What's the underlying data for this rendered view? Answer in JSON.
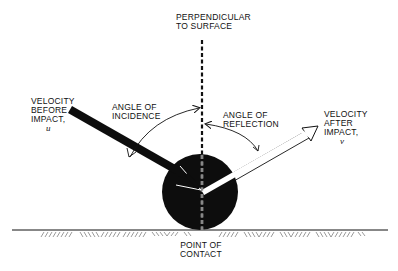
{
  "diagram": {
    "labels": {
      "perpendicular": [
        "PERPENDICULAR",
        "TO SURFACE"
      ],
      "velocity_before": [
        "VELOCITY",
        "BEFORE",
        "IMPACT,"
      ],
      "velocity_before_symbol": "u",
      "angle_incidence": [
        "ANGLE OF",
        "INCIDENCE"
      ],
      "angle_reflection": [
        "ANGLE OF",
        "REFLECTION"
      ],
      "velocity_after": [
        "VELOCITY",
        "AFTER",
        "IMPACT,"
      ],
      "velocity_after_symbol": "v",
      "point_of_contact": [
        "POINT OF",
        "CONTACT"
      ]
    },
    "colors": {
      "ink": "#111111",
      "background": "#ffffff",
      "ball": "#0d0d0d"
    },
    "nodes": [
      {
        "id": "ball",
        "shape": "circle",
        "cx": 200,
        "cy": 192,
        "r": 38
      },
      {
        "id": "ground",
        "shape": "line",
        "y": 230
      },
      {
        "id": "perpendicular",
        "shape": "dashed-line",
        "x": 202
      }
    ],
    "edges": [
      {
        "from": "velocity-before",
        "to": "ball",
        "style": "thick-solid-arrow"
      },
      {
        "from": "ball",
        "to": "velocity-after",
        "style": "hollow-arrow"
      },
      {
        "from": "angle-incidence-label",
        "to": "perpendicular",
        "style": "curved-arrow"
      },
      {
        "from": "angle-reflection-label",
        "to": "perpendicular",
        "style": "curved-arrow"
      }
    ]
  }
}
